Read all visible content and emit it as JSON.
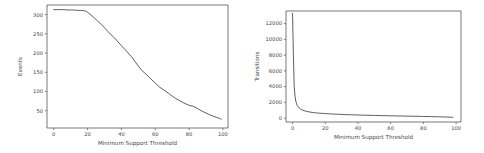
{
  "figure": {
    "background_color": "#ffffff",
    "line_color": "#4d4d4d",
    "axis_color": "#555555",
    "panel_count": 2
  },
  "chart_data": [
    {
      "type": "line",
      "panel": "left",
      "title": "",
      "xlabel": "Minimum Support Threshold",
      "ylabel": "Events",
      "xlim": [
        -4,
        103
      ],
      "ylim": [
        5,
        325
      ],
      "xticks": [
        0,
        20,
        40,
        60,
        80,
        100
      ],
      "xticklabels": [
        "0",
        "20",
        "40",
        "60",
        "80",
        "100"
      ],
      "yticks": [
        50,
        100,
        150,
        200,
        250,
        300
      ],
      "yticklabels": [
        "50",
        "100",
        "150",
        "200",
        "250",
        "300"
      ],
      "grid": false,
      "legend": false,
      "series": [
        {
          "name": "Events",
          "x": [
            0,
            2,
            4,
            6,
            8,
            10,
            12,
            14,
            16,
            18,
            19,
            20,
            22,
            24,
            26,
            28,
            30,
            32,
            34,
            36,
            38,
            40,
            42,
            44,
            46,
            48,
            50,
            52,
            54,
            56,
            58,
            60,
            62,
            64,
            66,
            68,
            70,
            72,
            74,
            76,
            78,
            80,
            82,
            84,
            86,
            88,
            90,
            92,
            94,
            96,
            98,
            99
          ],
          "values": [
            313,
            313,
            313,
            313,
            312,
            312,
            312,
            311,
            311,
            310,
            309,
            306,
            299,
            291,
            283,
            275,
            266,
            256,
            247,
            239,
            229,
            219,
            210,
            200,
            190,
            178,
            166,
            155,
            147,
            139,
            130,
            122,
            113,
            107,
            101,
            95,
            88,
            82,
            77,
            72,
            68,
            64,
            62,
            58,
            53,
            48,
            44,
            40,
            36,
            33,
            30,
            28
          ]
        }
      ]
    },
    {
      "type": "line",
      "panel": "right",
      "title": "",
      "xlabel": "Minimum Support Threshold",
      "ylabel": "Transitions",
      "xlim": [
        -4,
        103
      ],
      "ylim": [
        -500,
        13600
      ],
      "xticks": [
        0,
        20,
        40,
        60,
        80,
        100
      ],
      "xticklabels": [
        "0",
        "20",
        "40",
        "60",
        "80",
        "100"
      ],
      "yticks": [
        0,
        2000,
        4000,
        6000,
        8000,
        10000,
        12000
      ],
      "yticklabels": [
        "0",
        "2000",
        "4000",
        "6000",
        "8000",
        "10000",
        "12000"
      ],
      "grid": false,
      "legend": false,
      "series": [
        {
          "name": "Transitions",
          "x": [
            0,
            0.5,
            1,
            1.5,
            2,
            2.5,
            3,
            4,
            5,
            6,
            7,
            8,
            9,
            10,
            12,
            14,
            16,
            18,
            20,
            24,
            28,
            32,
            36,
            40,
            45,
            50,
            55,
            60,
            65,
            70,
            75,
            80,
            85,
            90,
            95,
            98
          ],
          "values": [
            13300,
            8200,
            4100,
            2800,
            2150,
            1800,
            1560,
            1290,
            1130,
            1020,
            940,
            880,
            830,
            790,
            720,
            670,
            630,
            600,
            570,
            520,
            480,
            445,
            415,
            390,
            360,
            335,
            310,
            288,
            268,
            248,
            228,
            205,
            180,
            155,
            125,
            105
          ]
        }
      ]
    }
  ]
}
